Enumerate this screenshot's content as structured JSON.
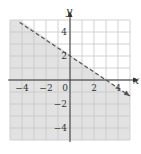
{
  "chart_data": {
    "type": "inequality-graph",
    "title": "",
    "xlabel": "x",
    "ylabel": "y",
    "xlim": [
      -5,
      5
    ],
    "ylim": [
      -5,
      5
    ],
    "grid": true,
    "x_tick_labels": [
      "-4",
      "-2",
      "0",
      "2",
      "4"
    ],
    "y_tick_labels": [
      "4",
      "2",
      "-2",
      "-4"
    ],
    "boundary_line": {
      "equation": "2x + 3y = 6",
      "points": [
        [
          0,
          2
        ],
        [
          3,
          0
        ]
      ],
      "style": "dashed",
      "slope": -0.6667,
      "intercept": 2
    },
    "shaded_region": "below",
    "inequality": "2x + 3y < 6"
  },
  "colors": {
    "shade": "#e2e2e2",
    "grid": "#c8c8c8",
    "axis": "#333333",
    "line": "#555555"
  }
}
